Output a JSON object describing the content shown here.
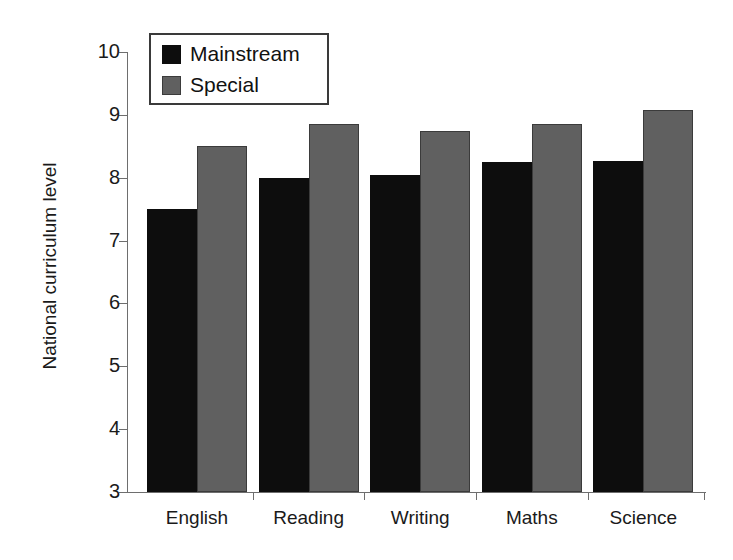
{
  "chart_data": {
    "type": "bar",
    "title": "",
    "xlabel": "",
    "ylabel": "National curriculum level",
    "ylim": [
      3,
      10
    ],
    "yticks": [
      3,
      4,
      5,
      6,
      7,
      8,
      9,
      10
    ],
    "grid": false,
    "legend_position": "top-left",
    "categories": [
      "English",
      "Reading",
      "Writing",
      "Maths",
      "Science"
    ],
    "series": [
      {
        "name": "Mainstream",
        "color": "#0d0d0d",
        "values": [
          7.5,
          8.0,
          8.05,
          8.25,
          8.27
        ]
      },
      {
        "name": "Special",
        "color": "#606060",
        "values": [
          8.5,
          8.85,
          8.75,
          8.85,
          9.07
        ]
      }
    ]
  },
  "axis": {
    "y_title": "National curriculum level",
    "y_tick_labels": [
      "10",
      "9",
      "8",
      "7",
      "6",
      "5",
      "4",
      "3"
    ]
  },
  "legend": {
    "items": [
      {
        "label": "Mainstream",
        "swatch": "mainstream-swatch"
      },
      {
        "label": "Special",
        "swatch": "special-swatch"
      }
    ]
  },
  "colors": {
    "mainstream": "#0d0d0d",
    "special": "#606060",
    "axis": "#6e6e6e",
    "text": "#1a1a1a",
    "background": "#ffffff"
  }
}
